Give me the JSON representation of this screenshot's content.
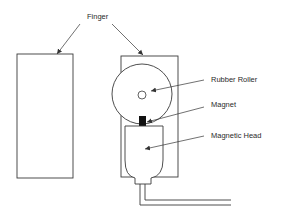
{
  "diagram": {
    "labels": {
      "finger": "Finger",
      "rubber_roller": "Rubber Roller",
      "magnet": "Magnet",
      "magnetic_head": "Magnetic Head"
    },
    "colors": {
      "line": "#3a3a3a",
      "magnet_fill": "#111111",
      "background": "#ffffff"
    }
  }
}
